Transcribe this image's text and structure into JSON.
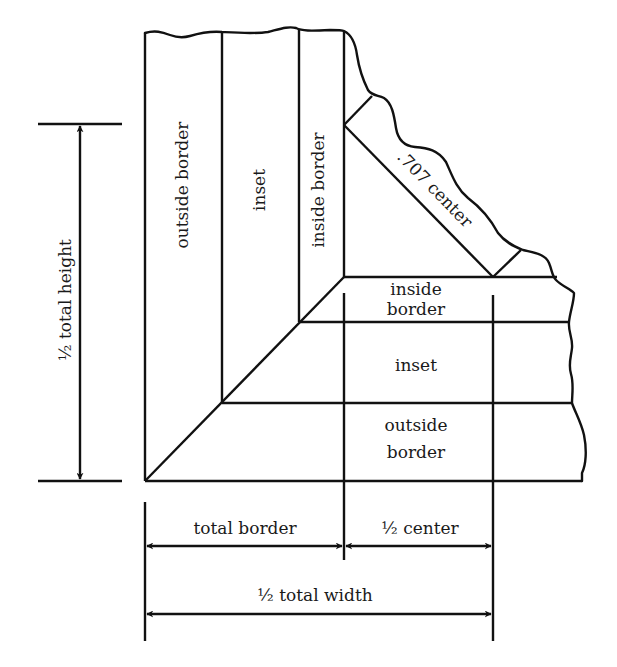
{
  "diagram": {
    "vertical_labels": {
      "outside_border": "outside border",
      "inset": "inset",
      "inside_border": "inside border"
    },
    "horizontal_labels": {
      "inside_border_line1": "inside",
      "inside_border_line2": "border",
      "inset": "inset",
      "outside_border_line1": "outside",
      "outside_border_line2": "border"
    },
    "diagonal_label": ".707 center",
    "dimensions": {
      "half_total_height": "½ total height",
      "total_border": "total border",
      "half_center": "½ center",
      "half_total_width": "½ total width"
    },
    "colors": {
      "stroke": "#111111",
      "background": "#ffffff"
    }
  }
}
